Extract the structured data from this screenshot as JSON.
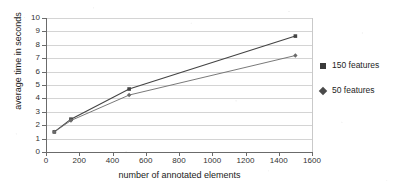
{
  "chart_data": {
    "type": "line",
    "title": "",
    "xlabel": "number of annotated elements",
    "ylabel": "average time in seconds",
    "xlim": [
      0,
      1600
    ],
    "ylim": [
      0,
      10
    ],
    "xticks": [
      0,
      200,
      400,
      600,
      800,
      1000,
      1200,
      1400,
      1600
    ],
    "xtick_labels": [
      "0",
      "200",
      "400",
      "600",
      "800",
      "1000",
      "1200",
      "1400",
      "1600"
    ],
    "yticks": [
      0,
      1,
      2,
      3,
      4,
      5,
      6,
      7,
      8,
      9,
      10
    ],
    "ytick_labels": [
      "0",
      "1",
      "2",
      "3",
      "4",
      "5",
      "6",
      "7",
      "8",
      "9",
      "10"
    ],
    "grid": "horizontal",
    "legend_position": "right",
    "x": [
      50,
      150,
      500,
      1500
    ],
    "series": [
      {
        "name": "150 features",
        "marker": "square",
        "color": "#444444",
        "values": [
          1.5,
          2.45,
          4.7,
          8.65
        ]
      },
      {
        "name": "50 features",
        "marker": "diamond",
        "color": "#6a6a6a",
        "values": [
          1.5,
          2.35,
          4.25,
          7.2
        ]
      }
    ]
  },
  "legend": {
    "items": [
      {
        "label": "150 features",
        "marker": "square-marker"
      },
      {
        "label": "50 features",
        "marker": "diamond-marker"
      }
    ]
  }
}
